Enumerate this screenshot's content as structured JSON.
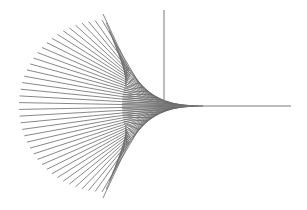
{
  "figure": {
    "type": "string-art line envelope",
    "width": 307,
    "height": 210,
    "background": "#ffffff",
    "line_color": "#6a6a6a",
    "axis_color": "#7a7a7a",
    "line_count": 40,
    "axes": {
      "origin": [
        164,
        106
      ],
      "vertical": {
        "x": 164,
        "y_top": 10,
        "y_bottom": 106
      },
      "horizontal": {
        "y": 106,
        "x_left": 164,
        "x_right": 291
      }
    },
    "left_arc": {
      "center": [
        105,
        106
      ],
      "radius": 86,
      "start_deg": 92,
      "end_deg": 268
    },
    "right_curve": {
      "top": [
        103,
        14
      ],
      "cusp": [
        213,
        106
      ],
      "bottom": [
        103,
        198
      ]
    }
  }
}
